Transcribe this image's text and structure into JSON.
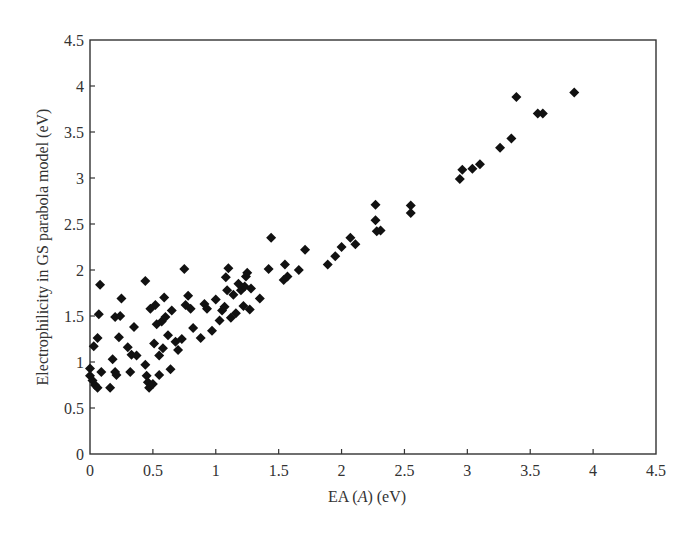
{
  "chart_data": {
    "type": "scatter",
    "title": "",
    "xlabel": "EA (A) (eV)",
    "xlabel_parts": [
      "EA (",
      "A",
      ") (eV)"
    ],
    "ylabel": "Electrophilicity in GS parabola model (eV)",
    "xlim": [
      0,
      4.5
    ],
    "ylim": [
      0,
      4.5
    ],
    "x_ticks": [
      "0",
      "0.5",
      "1",
      "1.5",
      "2",
      "2.5",
      "3",
      "3.5",
      "4",
      "4.5"
    ],
    "y_ticks": [
      "0",
      "0.5",
      "1",
      "1.5",
      "2",
      "2.5",
      "3",
      "3.5",
      "4",
      "4.5"
    ],
    "grid": false,
    "legend": null,
    "marker": "diamond",
    "marker_color": "#111111",
    "series": [
      {
        "name": "molecules",
        "points": [
          [
            0.0,
            0.93
          ],
          [
            0.0,
            0.85
          ],
          [
            0.02,
            0.8
          ],
          [
            0.04,
            0.75
          ],
          [
            0.06,
            0.72
          ],
          [
            0.03,
            1.17
          ],
          [
            0.06,
            1.26
          ],
          [
            0.07,
            1.52
          ],
          [
            0.08,
            1.84
          ],
          [
            0.09,
            0.89
          ],
          [
            0.16,
            0.72
          ],
          [
            0.18,
            1.03
          ],
          [
            0.2,
            1.49
          ],
          [
            0.2,
            0.89
          ],
          [
            0.21,
            0.86
          ],
          [
            0.23,
            1.27
          ],
          [
            0.24,
            1.5
          ],
          [
            0.25,
            1.69
          ],
          [
            0.3,
            1.16
          ],
          [
            0.32,
            0.89
          ],
          [
            0.33,
            1.08
          ],
          [
            0.35,
            1.38
          ],
          [
            0.37,
            1.07
          ],
          [
            0.44,
            0.97
          ],
          [
            0.44,
            1.88
          ],
          [
            0.45,
            0.85
          ],
          [
            0.46,
            0.78
          ],
          [
            0.47,
            0.72
          ],
          [
            0.48,
            1.58
          ],
          [
            0.5,
            0.76
          ],
          [
            0.51,
            1.2
          ],
          [
            0.52,
            1.62
          ],
          [
            0.53,
            1.41
          ],
          [
            0.55,
            1.07
          ],
          [
            0.55,
            0.86
          ],
          [
            0.57,
            1.44
          ],
          [
            0.58,
            1.15
          ],
          [
            0.59,
            1.7
          ],
          [
            0.6,
            1.49
          ],
          [
            0.62,
            1.29
          ],
          [
            0.64,
            0.92
          ],
          [
            0.65,
            1.56
          ],
          [
            0.68,
            1.22
          ],
          [
            0.7,
            1.13
          ],
          [
            0.73,
            1.25
          ],
          [
            0.75,
            2.01
          ],
          [
            0.76,
            1.62
          ],
          [
            0.78,
            1.72
          ],
          [
            0.8,
            1.58
          ],
          [
            0.82,
            1.37
          ],
          [
            0.88,
            1.26
          ],
          [
            0.91,
            1.63
          ],
          [
            0.93,
            1.58
          ],
          [
            0.97,
            1.34
          ],
          [
            1.0,
            1.68
          ],
          [
            1.03,
            1.45
          ],
          [
            1.05,
            1.56
          ],
          [
            1.07,
            1.6
          ],
          [
            1.08,
            1.92
          ],
          [
            1.09,
            1.78
          ],
          [
            1.1,
            2.02
          ],
          [
            1.12,
            1.48
          ],
          [
            1.14,
            1.73
          ],
          [
            1.16,
            1.53
          ],
          [
            1.18,
            1.85
          ],
          [
            1.2,
            1.78
          ],
          [
            1.22,
            1.61
          ],
          [
            1.23,
            1.82
          ],
          [
            1.24,
            1.93
          ],
          [
            1.25,
            1.97
          ],
          [
            1.27,
            1.57
          ],
          [
            1.28,
            1.8
          ],
          [
            1.35,
            1.69
          ],
          [
            1.42,
            2.01
          ],
          [
            1.44,
            2.35
          ],
          [
            1.54,
            1.89
          ],
          [
            1.55,
            2.06
          ],
          [
            1.57,
            1.93
          ],
          [
            1.66,
            2.0
          ],
          [
            1.71,
            2.22
          ],
          [
            1.89,
            2.06
          ],
          [
            1.95,
            2.15
          ],
          [
            2.0,
            2.25
          ],
          [
            2.07,
            2.35
          ],
          [
            2.11,
            2.28
          ],
          [
            2.27,
            2.71
          ],
          [
            2.27,
            2.54
          ],
          [
            2.28,
            2.42
          ],
          [
            2.31,
            2.43
          ],
          [
            2.55,
            2.7
          ],
          [
            2.55,
            2.62
          ],
          [
            2.94,
            2.99
          ],
          [
            2.96,
            3.09
          ],
          [
            3.04,
            3.1
          ],
          [
            3.1,
            3.15
          ],
          [
            3.26,
            3.33
          ],
          [
            3.35,
            3.43
          ],
          [
            3.39,
            3.88
          ],
          [
            3.56,
            3.7
          ],
          [
            3.6,
            3.7
          ],
          [
            3.85,
            3.93
          ]
        ]
      }
    ]
  }
}
